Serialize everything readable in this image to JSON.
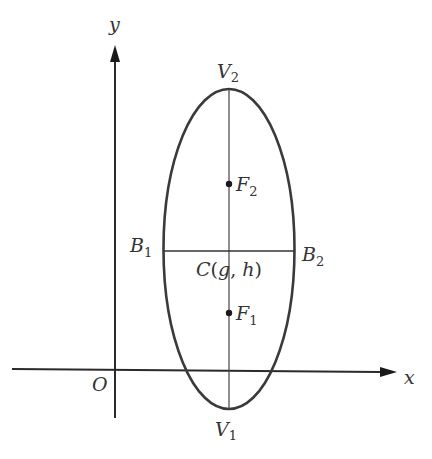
{
  "diagram": {
    "colors": {
      "stroke": "#3a3a3a",
      "text": "#333333",
      "background": "#ffffff"
    },
    "axes": {
      "x_label": "x",
      "y_label": "y",
      "origin_label": "O"
    },
    "points": {
      "V2": {
        "name": "V",
        "sub": "2"
      },
      "V1": {
        "name": "V",
        "sub": "1"
      },
      "F2": {
        "name": "F",
        "sub": "2"
      },
      "F1": {
        "name": "F",
        "sub": "1"
      },
      "B1": {
        "name": "B",
        "sub": "1"
      },
      "B2": {
        "name": "B",
        "sub": "2"
      },
      "C": {
        "name": "C",
        "open": "(",
        "g": "g",
        "comma": ", ",
        "h": "h",
        "close": ")"
      }
    }
  }
}
